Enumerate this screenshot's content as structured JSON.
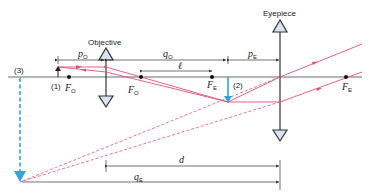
{
  "diagram": {
    "colors": {
      "axis": "#333333",
      "ray": "#e0507a",
      "image_arrow": "#29a8e0",
      "lens_fill": "#d9e4ee",
      "text": "#222222"
    },
    "labels": {
      "objective": "Objective",
      "eyepiece": "Eyepiece",
      "object_label": "(1)",
      "intermediate_image_label": "(2)",
      "final_image_label": "(3)",
      "focal_objective": "F",
      "focal_objective_sub": "O",
      "focal_eyepiece": "F",
      "focal_eyepiece_sub": "E",
      "p_o": "p",
      "p_o_sub": "O",
      "q_o": "q",
      "q_o_sub": "O",
      "p_e": "p",
      "p_e_sub": "E",
      "q_e": "q",
      "q_e_sub": "E",
      "ell": "ℓ",
      "d": "d"
    }
  }
}
